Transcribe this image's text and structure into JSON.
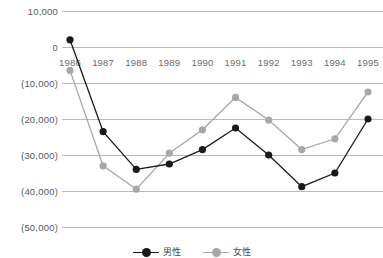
{
  "chart_data": {
    "type": "line",
    "title": "",
    "xlabel": "",
    "ylabel": "",
    "categories": [
      "1986",
      "1987",
      "1988",
      "1989",
      "1990",
      "1991",
      "1992",
      "1993",
      "1994",
      "1995"
    ],
    "ylim": [
      -50000,
      10000
    ],
    "yticks": [
      10000,
      0,
      -10000,
      -20000,
      -30000,
      -40000,
      -50000
    ],
    "ytick_labels": [
      "10,000",
      "0",
      "(10,000)",
      "(20,000)",
      "(30,000)",
      "(40,000)",
      "(50,000)"
    ],
    "grid": true,
    "legend_position": "bottom",
    "series": [
      {
        "name": "男性",
        "color": "#1a1a1a",
        "marker": "circle",
        "values": [
          2000,
          -23500,
          -34000,
          -32500,
          -28500,
          -22500,
          -30000,
          -38800,
          -35000,
          -20000
        ]
      },
      {
        "name": "女性",
        "color": "#a8a8a8",
        "marker": "circle",
        "values": [
          -6500,
          -33000,
          -39500,
          -29500,
          -23000,
          -14000,
          -20300,
          -28500,
          -25500,
          -12500
        ]
      }
    ]
  },
  "legend": {
    "entries": [
      {
        "label": "男性",
        "color": "#1a1a1a"
      },
      {
        "label": "女性",
        "color": "#a8a8a8"
      }
    ]
  },
  "axes": {
    "y_tick_labels": [
      "10,000",
      "0",
      "(10,000)",
      "(20,000)",
      "(30,000)",
      "(40,000)",
      "(50,000)"
    ],
    "x_tick_labels": [
      "1986",
      "1987",
      "1988",
      "1989",
      "1990",
      "1991",
      "1992",
      "1993",
      "1994",
      "1995"
    ]
  },
  "colors": {
    "grid": "#b9b9b9",
    "axis_text": "#5a5a5a",
    "series_male": "#1a1a1a",
    "series_female": "#a8a8a8",
    "background": "#ffffff"
  }
}
